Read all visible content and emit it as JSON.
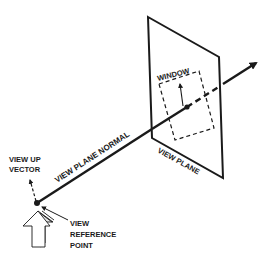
{
  "diagram": {
    "type": "3d-viewing-geometry",
    "colors": {
      "ink": "#1a1a1a",
      "background": "#ffffff"
    },
    "labels": {
      "window": "WINDOW",
      "view_plane_normal": "VIEW PLANE NORMAL",
      "view_plane": "VIEW PLANE",
      "view_up_line1": "VIEW UP",
      "view_up_line2": "VECTOR",
      "vrp_line1": "VIEW",
      "vrp_line2": "REFERENCE",
      "vrp_line3": "POINT"
    },
    "elements": [
      {
        "id": "view-plane",
        "shape": "parallelogram"
      },
      {
        "id": "window",
        "shape": "dashed-rectangle"
      },
      {
        "id": "view-plane-normal",
        "shape": "arrow",
        "style": "solid-dashed-behind-plane-solid"
      },
      {
        "id": "view-up-vector",
        "shape": "dashed-arrow"
      },
      {
        "id": "view-reference-point",
        "shape": "dot"
      },
      {
        "id": "up-indicator",
        "shape": "hollow-3d-arrow"
      }
    ]
  }
}
